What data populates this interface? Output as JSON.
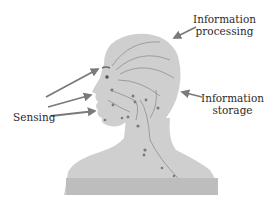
{
  "diagram": {
    "type": "annotated-illustration",
    "labels": {
      "processing_line1": "Information",
      "processing_line2": "processing",
      "storage_line1": "Information",
      "storage_line2": "storage",
      "sensing": "Sensing"
    },
    "colors": {
      "figure_fill": "#cfcfcf",
      "figure_dark": "#bdbdbd",
      "shoulder_band": "#b9b9b9",
      "nerve": "#8a8a8a",
      "arrow": "#7a7a7a",
      "text": "#2a2a2a",
      "background": "#ffffff"
    }
  }
}
